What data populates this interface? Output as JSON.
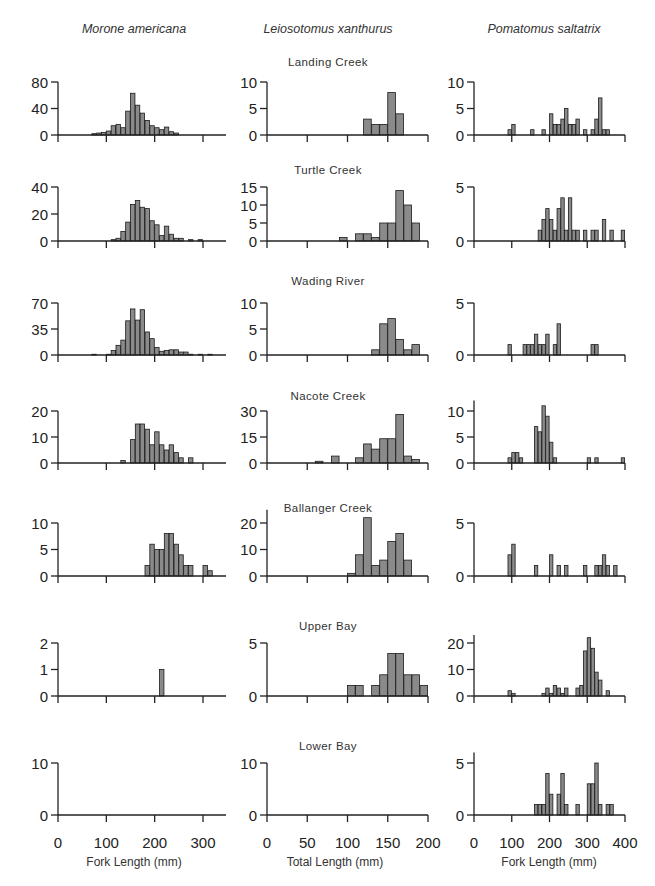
{
  "figure": {
    "species": [
      "Morone americana",
      "Leiosotomus xanthurus",
      "Pomatomus saltatrix"
    ],
    "x_axis_titles": [
      "Fork Length (mm)",
      "Total Length (mm)",
      "Fork Length (mm)"
    ],
    "x_tick_labels": [
      [
        "0",
        "100",
        "200",
        "300"
      ],
      [
        "0",
        "50",
        "100",
        "150",
        "200"
      ],
      [
        "0",
        "100",
        "200",
        "300",
        "400"
      ]
    ],
    "sites": [
      "Landing Creek",
      "Turtle Creek",
      "Wading River",
      "Nacote Creek",
      "Ballanger Creek",
      "Upper Bay",
      "Lower Bay"
    ],
    "colors": {
      "bar_fill": "#8a8a8a",
      "bar_edge": "#1a1a1a",
      "axis": "#222222",
      "background": "#ffffff"
    }
  },
  "chart_data": [
    {
      "type": "bar",
      "row": 0,
      "col": 0,
      "site": "Landing Creek",
      "species": "Morone americana",
      "xlabel": "Fork Length (mm)",
      "ylabel": "",
      "xlim": [
        0,
        350
      ],
      "ylim": [
        0,
        80
      ],
      "yticks": [
        0,
        40,
        80
      ],
      "bin_width": 10,
      "x": [
        70,
        80,
        90,
        100,
        110,
        120,
        130,
        140,
        150,
        160,
        170,
        180,
        190,
        200,
        210,
        220,
        230,
        240
      ],
      "values": [
        2,
        3,
        4,
        6,
        14,
        16,
        11,
        36,
        63,
        45,
        33,
        22,
        14,
        11,
        8,
        12,
        5,
        3
      ]
    },
    {
      "type": "bar",
      "row": 0,
      "col": 1,
      "site": "Landing Creek",
      "species": "Leiosotomus xanthurus",
      "xlabel": "Total Length (mm)",
      "ylabel": "",
      "xlim": [
        0,
        200
      ],
      "ylim": [
        0,
        10
      ],
      "yticks": [
        0,
        5,
        10
      ],
      "bin_width": 10,
      "x": [
        120,
        130,
        140,
        150,
        160
      ],
      "values": [
        3,
        2,
        2,
        8,
        4
      ]
    },
    {
      "type": "bar",
      "row": 0,
      "col": 2,
      "site": "Landing Creek",
      "species": "Pomatomus saltatrix",
      "xlabel": "Fork Length (mm)",
      "ylabel": "",
      "xlim": [
        0,
        400
      ],
      "ylim": [
        0,
        10
      ],
      "yticks": [
        0,
        5,
        10
      ],
      "bin_width": 10,
      "x": [
        90,
        100,
        150,
        180,
        200,
        210,
        220,
        230,
        240,
        250,
        260,
        270,
        290,
        310,
        320,
        330,
        340,
        350
      ],
      "values": [
        1,
        2,
        1,
        1,
        4,
        2,
        2,
        3,
        5,
        2,
        2,
        3,
        1,
        1,
        3,
        7,
        1,
        1
      ]
    },
    {
      "type": "bar",
      "row": 1,
      "col": 0,
      "site": "Turtle Creek",
      "species": "Morone americana",
      "xlabel": "Fork Length (mm)",
      "ylabel": "",
      "xlim": [
        0,
        350
      ],
      "ylim": [
        0,
        40
      ],
      "yticks": [
        0,
        20,
        40
      ],
      "bin_width": 10,
      "x": [
        110,
        120,
        130,
        140,
        150,
        160,
        170,
        180,
        190,
        200,
        210,
        220,
        230,
        240,
        250,
        270,
        290
      ],
      "values": [
        1,
        2,
        7,
        14,
        27,
        30,
        25,
        24,
        15,
        12,
        4,
        11,
        5,
        2,
        2,
        1,
        1
      ]
    },
    {
      "type": "bar",
      "row": 1,
      "col": 1,
      "site": "Turtle Creek",
      "species": "Leiosotomus xanthurus",
      "xlabel": "Total Length (mm)",
      "ylabel": "",
      "xlim": [
        0,
        200
      ],
      "ylim": [
        0,
        15
      ],
      "yticks": [
        0,
        5,
        10,
        15
      ],
      "bin_width": 10,
      "x": [
        90,
        110,
        120,
        130,
        140,
        150,
        160,
        170,
        180
      ],
      "values": [
        1,
        2,
        2,
        1,
        5,
        5,
        14,
        10,
        5
      ]
    },
    {
      "type": "bar",
      "row": 1,
      "col": 2,
      "site": "Turtle Creek",
      "species": "Pomatomus saltatrix",
      "xlabel": "Fork Length (mm)",
      "ylabel": "",
      "xlim": [
        0,
        400
      ],
      "ylim": [
        0,
        5
      ],
      "yticks": [
        0,
        5
      ],
      "bin_width": 10,
      "x": [
        170,
        180,
        190,
        200,
        210,
        220,
        230,
        240,
        250,
        260,
        270,
        290,
        310,
        320,
        340,
        360,
        390
      ],
      "values": [
        1,
        2,
        3,
        2,
        1,
        3,
        4,
        1,
        4,
        1,
        1,
        1,
        1,
        1,
        2,
        1,
        1
      ]
    },
    {
      "type": "bar",
      "row": 2,
      "col": 0,
      "site": "Wading River",
      "species": "Morone americana",
      "xlabel": "Fork Length (mm)",
      "ylabel": "",
      "xlim": [
        0,
        350
      ],
      "ylim": [
        0,
        70
      ],
      "yticks": [
        0,
        35,
        70
      ],
      "bin_width": 10,
      "x": [
        70,
        100,
        110,
        120,
        130,
        140,
        150,
        160,
        170,
        180,
        190,
        200,
        210,
        220,
        230,
        240,
        250,
        260,
        270,
        290,
        310
      ],
      "values": [
        1,
        1,
        6,
        13,
        20,
        46,
        62,
        47,
        61,
        31,
        22,
        10,
        5,
        6,
        7,
        7,
        4,
        4,
        1,
        1,
        1
      ]
    },
    {
      "type": "bar",
      "row": 2,
      "col": 1,
      "site": "Wading River",
      "species": "Leiosotomus xanthurus",
      "xlabel": "Total Length (mm)",
      "ylabel": "",
      "xlim": [
        0,
        200
      ],
      "ylim": [
        0,
        10
      ],
      "yticks": [
        0,
        5,
        10
      ],
      "bin_width": 10,
      "x": [
        130,
        140,
        150,
        160,
        170,
        180
      ],
      "values": [
        1,
        6,
        7,
        3,
        1,
        2
      ]
    },
    {
      "type": "bar",
      "row": 2,
      "col": 2,
      "site": "Wading River",
      "species": "Pomatomus saltatrix",
      "xlabel": "Fork Length (mm)",
      "ylabel": "",
      "xlim": [
        0,
        400
      ],
      "ylim": [
        0,
        5
      ],
      "yticks": [
        0,
        5
      ],
      "bin_width": 10,
      "x": [
        90,
        130,
        140,
        150,
        160,
        170,
        180,
        190,
        210,
        220,
        310,
        320
      ],
      "values": [
        1,
        1,
        1,
        1,
        2,
        1,
        1,
        2,
        1,
        3,
        1,
        1
      ]
    },
    {
      "type": "bar",
      "row": 3,
      "col": 0,
      "site": "Nacote Creek",
      "species": "Morone americana",
      "xlabel": "Fork Length (mm)",
      "ylabel": "",
      "xlim": [
        0,
        350
      ],
      "ylim": [
        0,
        20
      ],
      "yticks": [
        0,
        10,
        20
      ],
      "bin_width": 10,
      "x": [
        130,
        150,
        160,
        170,
        180,
        190,
        200,
        210,
        220,
        230,
        240,
        250,
        270
      ],
      "values": [
        1,
        9,
        15,
        15,
        13,
        7,
        12,
        7,
        5,
        7,
        4,
        2,
        2
      ]
    },
    {
      "type": "bar",
      "row": 3,
      "col": 1,
      "site": "Nacote Creek",
      "species": "Leiosotomus xanthurus",
      "xlabel": "Total Length (mm)",
      "ylabel": "",
      "xlim": [
        0,
        200
      ],
      "ylim": [
        0,
        30
      ],
      "yticks": [
        0,
        15,
        30
      ],
      "bin_width": 10,
      "x": [
        60,
        80,
        110,
        120,
        130,
        140,
        150,
        160,
        170,
        180
      ],
      "values": [
        1,
        4,
        3,
        11,
        8,
        14,
        14,
        28,
        4,
        2
      ]
    },
    {
      "type": "bar",
      "row": 3,
      "col": 2,
      "site": "Nacote Creek",
      "species": "Pomatomus saltatrix",
      "xlabel": "Fork Length (mm)",
      "ylabel": "",
      "xlim": [
        0,
        400
      ],
      "ylim": [
        0,
        12
      ],
      "yticks": [
        0,
        5,
        10
      ],
      "bin_width": 10,
      "x": [
        90,
        100,
        110,
        120,
        160,
        170,
        180,
        190,
        200,
        210,
        300,
        320,
        390
      ],
      "values": [
        1,
        2,
        2,
        1,
        7,
        6,
        11,
        9,
        4,
        1,
        1,
        1,
        1
      ]
    },
    {
      "type": "bar",
      "row": 4,
      "col": 0,
      "site": "Ballanger Creek",
      "species": "Morone americana",
      "xlabel": "Fork Length (mm)",
      "ylabel": "",
      "xlim": [
        0,
        350
      ],
      "ylim": [
        0,
        10
      ],
      "yticks": [
        0,
        5,
        10
      ],
      "bin_width": 10,
      "x": [
        180,
        190,
        200,
        210,
        220,
        230,
        240,
        250,
        260,
        270,
        300,
        310
      ],
      "values": [
        2,
        6,
        5,
        5,
        8,
        8,
        6,
        4,
        2,
        2,
        2,
        1
      ]
    },
    {
      "type": "bar",
      "row": 4,
      "col": 1,
      "site": "Ballanger Creek",
      "species": "Leiosotomus xanthurus",
      "xlabel": "Total Length (mm)",
      "ylabel": "",
      "xlim": [
        0,
        200
      ],
      "ylim": [
        0,
        25
      ],
      "yticks": [
        0,
        10,
        20
      ],
      "bin_width": 10,
      "x": [
        100,
        110,
        120,
        130,
        140,
        150,
        160,
        170
      ],
      "values": [
        1,
        8,
        22,
        4,
        6,
        13,
        16,
        6
      ]
    },
    {
      "type": "bar",
      "row": 4,
      "col": 2,
      "site": "Ballanger Creek",
      "species": "Pomatomus saltatrix",
      "xlabel": "Fork Length (mm)",
      "ylabel": "",
      "xlim": [
        0,
        400
      ],
      "ylim": [
        0,
        5
      ],
      "yticks": [
        0,
        5
      ],
      "bin_width": 10,
      "x": [
        90,
        100,
        160,
        200,
        220,
        240,
        290,
        320,
        330,
        340,
        350,
        370
      ],
      "values": [
        2,
        3,
        1,
        2,
        1,
        1,
        1,
        1,
        1,
        2,
        1,
        1
      ]
    },
    {
      "type": "bar",
      "row": 5,
      "col": 0,
      "site": "Upper Bay",
      "species": "Morone americana",
      "xlabel": "Fork Length (mm)",
      "ylabel": "",
      "xlim": [
        0,
        350
      ],
      "ylim": [
        0,
        2
      ],
      "yticks": [
        0,
        1,
        2
      ],
      "bin_width": 10,
      "x": [
        210
      ],
      "values": [
        1
      ]
    },
    {
      "type": "bar",
      "row": 5,
      "col": 1,
      "site": "Upper Bay",
      "species": "Leiosotomus xanthurus",
      "xlabel": "Total Length (mm)",
      "ylabel": "",
      "xlim": [
        0,
        200
      ],
      "ylim": [
        0,
        5
      ],
      "yticks": [
        0,
        5
      ],
      "bin_width": 10,
      "x": [
        100,
        110,
        130,
        140,
        150,
        160,
        170,
        180,
        190
      ],
      "values": [
        1,
        1,
        1,
        2,
        4,
        4,
        2,
        2,
        1
      ]
    },
    {
      "type": "bar",
      "row": 5,
      "col": 2,
      "site": "Upper Bay",
      "species": "Pomatomus saltatrix",
      "xlabel": "Fork Length (mm)",
      "ylabel": "",
      "xlim": [
        0,
        400
      ],
      "ylim": [
        0,
        23
      ],
      "yticks": [
        0,
        10,
        20
      ],
      "bin_width": 10,
      "x": [
        90,
        100,
        180,
        190,
        200,
        210,
        220,
        230,
        240,
        270,
        280,
        290,
        300,
        310,
        320,
        330,
        350
      ],
      "values": [
        2,
        1,
        1,
        3,
        1,
        4,
        3,
        1,
        3,
        3,
        4,
        17,
        22,
        18,
        9,
        6,
        2
      ]
    },
    {
      "type": "bar",
      "row": 6,
      "col": 0,
      "site": "Lower Bay",
      "species": "Morone americana",
      "xlabel": "Fork Length (mm)",
      "ylabel": "",
      "xlim": [
        0,
        350
      ],
      "ylim": [
        0,
        10
      ],
      "yticks": [
        0,
        10
      ],
      "bin_width": 10,
      "x": [],
      "values": []
    },
    {
      "type": "bar",
      "row": 6,
      "col": 1,
      "site": "Lower Bay",
      "species": "Leiosotomus xanthurus",
      "xlabel": "Total Length (mm)",
      "ylabel": "",
      "xlim": [
        0,
        200
      ],
      "ylim": [
        0,
        10
      ],
      "yticks": [
        0,
        10
      ],
      "bin_width": 10,
      "x": [],
      "values": []
    },
    {
      "type": "bar",
      "row": 6,
      "col": 2,
      "site": "Lower Bay",
      "species": "Pomatomus saltatrix",
      "xlabel": "Fork Length (mm)",
      "ylabel": "",
      "xlim": [
        0,
        400
      ],
      "ylim": [
        0,
        6
      ],
      "yticks": [
        0,
        5
      ],
      "bin_width": 10,
      "x": [
        160,
        170,
        180,
        190,
        200,
        220,
        230,
        240,
        270,
        300,
        310,
        320,
        330,
        350,
        360
      ],
      "values": [
        1,
        1,
        1,
        4,
        2,
        2,
        4,
        1,
        1,
        3,
        3,
        5,
        1,
        1,
        1
      ]
    }
  ]
}
